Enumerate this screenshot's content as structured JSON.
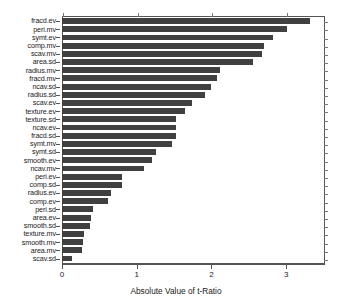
{
  "chart_data": {
    "type": "bar",
    "orientation": "horizontal",
    "title": "",
    "xlabel": "Absolute Value of t-Ratio",
    "ylabel": "",
    "xlim": [
      0,
      3.52
    ],
    "xticks": [
      0,
      1,
      2,
      3
    ],
    "xtick_labels": [
      "0",
      "1",
      "2",
      "3"
    ],
    "grid": false,
    "legend": null,
    "bar_color": "#404040",
    "frame_color": "#555555",
    "categories": [
      "fracd.ev",
      "peri.mv",
      "symt.ev",
      "comp.mv",
      "scav.mv",
      "area.sd",
      "radius.mv",
      "fracd.mv",
      "ncav.sd",
      "radius.sd",
      "scav.ev",
      "texture.ev",
      "texture.sd",
      "ncav.ev",
      "fracd.sd",
      "symt.mv",
      "symt.sd",
      "smooth.ev",
      "ncav.mv",
      "peri.ev",
      "comp.sd",
      "radius.ev",
      "comp.ev",
      "peri.sd",
      "area.ev",
      "smooth.sd",
      "texture.mv",
      "smooth.mv",
      "area.mv",
      "scav.sd"
    ],
    "values": [
      3.32,
      3.01,
      2.82,
      2.7,
      2.68,
      2.56,
      2.12,
      2.07,
      1.99,
      1.92,
      1.74,
      1.65,
      1.53,
      1.52,
      1.52,
      1.47,
      1.26,
      1.21,
      1.1,
      0.8,
      0.8,
      0.66,
      0.62,
      0.41,
      0.39,
      0.38,
      0.29,
      0.28,
      0.27,
      0.14
    ]
  }
}
